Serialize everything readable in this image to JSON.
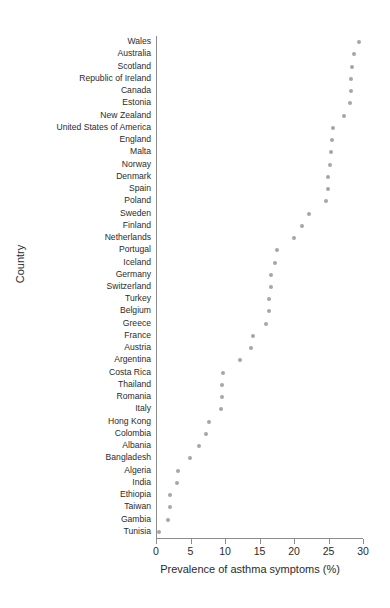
{
  "chart_data": {
    "type": "scatter",
    "title": "",
    "xlabel": "Prevalence of asthma symptoms (%)",
    "ylabel": "Country",
    "xlim": [
      0,
      30
    ],
    "xticks": [
      0,
      5,
      10,
      15,
      20,
      25,
      30
    ],
    "xticklabels": [
      "0",
      "5",
      "10",
      "15",
      "20",
      "25",
      "30"
    ],
    "grid": false,
    "legend": null,
    "orientation": "horizontal-dotplot",
    "marker": {
      "shape": "circle",
      "color": "#a6a6a6",
      "size": 4
    },
    "categories": [
      "Wales",
      "Australia",
      "Scotland",
      "Republic of Ireland",
      "Canada",
      "Estonia",
      "New Zealand",
      "United States of America",
      "England",
      "Malta",
      "Norway",
      "Denmark",
      "Spain",
      "Poland",
      "Sweden",
      "Finland",
      "Netherlands",
      "Portugal",
      "Iceland",
      "Germany",
      "Switzerland",
      "Turkey",
      "Belgium",
      "Greece",
      "France",
      "Austria",
      "Argentina",
      "Costa Rica",
      "Thailand",
      "Romania",
      "Italy",
      "Hong Kong",
      "Colombia",
      "Albania",
      "Bangladesh",
      "Algeria",
      "India",
      "Ethiopia",
      "Taiwan",
      "Gambia",
      "Tunisia"
    ],
    "values": [
      29.4,
      28.7,
      28.4,
      28.3,
      28.2,
      28.1,
      27.2,
      25.6,
      25.5,
      25.4,
      25.2,
      24.9,
      24.9,
      24.6,
      22.2,
      21.2,
      20.0,
      17.6,
      17.3,
      16.6,
      16.6,
      16.4,
      16.4,
      15.9,
      14.0,
      13.8,
      12.2,
      9.7,
      9.6,
      9.5,
      9.4,
      7.7,
      7.2,
      6.3,
      4.9,
      3.2,
      3.0,
      2.1,
      2.0,
      1.7,
      0.5
    ]
  },
  "axis": {
    "x_title": "Prevalence of asthma symptoms (%)",
    "y_title": "Country"
  },
  "colors": {
    "marker": "#a6a6a6",
    "axis": "#8c8c8c",
    "text": "#2b2b2b",
    "background": "#ffffff"
  }
}
